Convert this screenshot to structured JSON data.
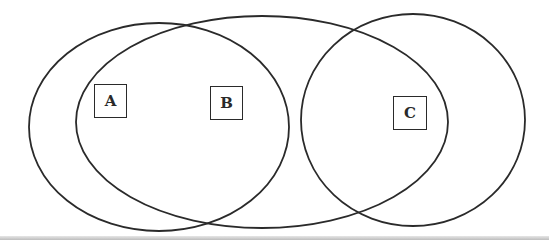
{
  "diagram": {
    "type": "venn",
    "stroke_color": "#2a2a2a",
    "background_color": "#ffffff",
    "sets": [
      {
        "id": "A",
        "label": "A",
        "shape": "ellipse",
        "cx": 159,
        "cy": 127,
        "rx": 130,
        "ry": 104
      },
      {
        "id": "B",
        "label": "B",
        "shape": "ellipse",
        "cx": 262,
        "cy": 122,
        "rx": 186,
        "ry": 106
      },
      {
        "id": "C",
        "label": "C",
        "shape": "ellipse",
        "cx": 413,
        "cy": 120,
        "rx": 112,
        "ry": 106
      }
    ],
    "labels": {
      "a": "A",
      "b": "B",
      "c": "C"
    }
  }
}
